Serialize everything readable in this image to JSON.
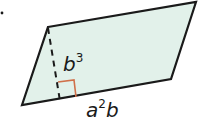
{
  "figure": {
    "shape": "parallelogram",
    "fill_color": "#e2f1ea",
    "stroke_color": "#1a1a1a",
    "marker_color": "#d0704a",
    "vertices": [
      [
        48,
        27
      ],
      [
        196,
        2
      ],
      [
        171,
        79
      ],
      [
        22,
        105
      ]
    ],
    "height_label": {
      "base": "b",
      "exp": "3"
    },
    "base_label": {
      "base": "a",
      "exp": "2",
      "tail": "b"
    }
  }
}
